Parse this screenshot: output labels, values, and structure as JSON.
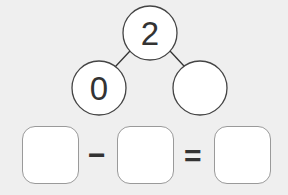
{
  "number_bond": {
    "whole": "2",
    "left_part": "0",
    "right_part": ""
  },
  "equation": {
    "term1": "",
    "operator1": "−",
    "term2": "",
    "operator2": "=",
    "result": ""
  }
}
